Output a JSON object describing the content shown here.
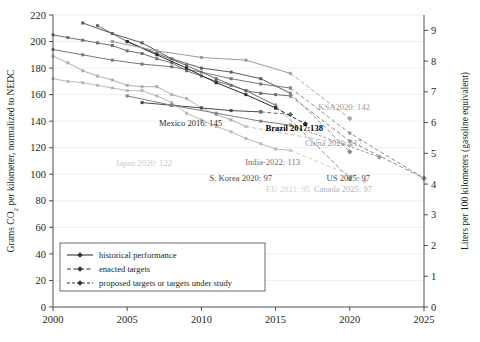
{
  "chart_data": {
    "type": "line",
    "title": "",
    "xlabel": "",
    "ylabel": "Grams CO2 per kilometer, normalized to NEDC",
    "ylabel_right": "Liters per 100 kilometers (gasoline equivalent)",
    "xlim": [
      2000,
      2025
    ],
    "ylim": [
      0,
      220
    ],
    "ylim_right": [
      0,
      9.5
    ],
    "xticks": [
      "2000",
      "2005",
      "2010",
      "2015",
      "2020",
      "2025"
    ],
    "yticks": [
      "0",
      "20",
      "40",
      "60",
      "80",
      "100",
      "120",
      "140",
      "160",
      "180",
      "200",
      "220"
    ],
    "yticks_right": [
      "0",
      "1",
      "2",
      "3",
      "4",
      "5",
      "6",
      "7",
      "8",
      "9"
    ],
    "grid": true,
    "legend_position": "lower-left",
    "legend": [
      {
        "label": "historical performance",
        "style": "solid"
      },
      {
        "label": "enacted targets",
        "style": "dashed-diamond"
      },
      {
        "label": "proposed targets or targets under study",
        "style": "dashed-small"
      }
    ],
    "series": [
      {
        "name": "EU",
        "color": "#b9b9b9",
        "kind": "historical",
        "x": [
          2000,
          2001,
          2002,
          2003,
          2004,
          2005,
          2006,
          2007,
          2008,
          2009,
          2010,
          2011,
          2012,
          2013,
          2014,
          2015,
          2016
        ],
        "y": [
          172,
          170,
          169,
          167,
          165,
          163,
          163,
          159,
          154,
          146,
          141,
          136,
          132,
          127,
          123,
          119,
          118
        ]
      },
      {
        "name": "EU target",
        "color": "#cfcfcf",
        "kind": "enacted",
        "x": [
          2016,
          2021
        ],
        "y": [
          118,
          95
        ]
      },
      {
        "name": "Japan",
        "color": "#b0b0b0",
        "kind": "historical",
        "x": [
          2000,
          2001,
          2002,
          2003,
          2004,
          2005,
          2006,
          2007,
          2008,
          2009,
          2010,
          2011,
          2012,
          2013
        ],
        "y": [
          189,
          184,
          178,
          174,
          171,
          167,
          166,
          166,
          160,
          157,
          150,
          145,
          141,
          136
        ]
      },
      {
        "name": "Japan target",
        "color": "#c4c4c4",
        "kind": "enacted",
        "x": [
          2013,
          2020
        ],
        "y": [
          136,
          122
        ]
      },
      {
        "name": "US",
        "color": "#6f6f6f",
        "kind": "historical",
        "x": [
          2000,
          2001,
          2002,
          2003,
          2004,
          2005,
          2006,
          2007,
          2008,
          2009,
          2010,
          2011,
          2012,
          2013,
          2014,
          2015,
          2016
        ],
        "y": [
          205,
          203,
          201,
          199,
          197,
          193,
          191,
          187,
          184,
          178,
          174,
          170,
          167,
          163,
          161,
          160,
          159
        ]
      },
      {
        "name": "US target",
        "color": "#8a8a8a",
        "kind": "enacted",
        "x": [
          2016,
          2020,
          2025
        ],
        "y": [
          159,
          125,
          97
        ]
      },
      {
        "name": "Canada",
        "color": "#777777",
        "kind": "historical",
        "x": [
          2000,
          2002,
          2004,
          2006,
          2008,
          2010,
          2012,
          2014,
          2016
        ],
        "y": [
          194,
          190,
          186,
          183,
          181,
          177,
          172,
          168,
          165
        ]
      },
      {
        "name": "Canada target",
        "color": "#8e8e8e",
        "kind": "enacted",
        "x": [
          2016,
          2020,
          2025
        ],
        "y": [
          165,
          131,
          97
        ]
      },
      {
        "name": "China",
        "color": "#5c5c5c",
        "kind": "historical",
        "x": [
          2002,
          2004,
          2006,
          2008,
          2010,
          2012,
          2014,
          2016
        ],
        "y": [
          214,
          206,
          199,
          187,
          180,
          177,
          172,
          161
        ]
      },
      {
        "name": "China target",
        "color": "#8b8b8b",
        "kind": "enacted",
        "x": [
          2016,
          2020
        ],
        "y": [
          161,
          117
        ]
      },
      {
        "name": "S. Korea",
        "color": "#6b6b6b",
        "kind": "historical",
        "x": [
          2003,
          2005,
          2007,
          2009,
          2011,
          2013,
          2015
        ],
        "y": [
          212,
          200,
          191,
          182,
          172,
          163,
          152
        ]
      },
      {
        "name": "S. Korea target",
        "color": "#8f8f8f",
        "kind": "enacted",
        "x": [
          2015,
          2020
        ],
        "y": [
          152,
          97
        ]
      },
      {
        "name": "Mexico",
        "color": "#4a4a4a",
        "kind": "historical",
        "x": [
          2006,
          2008,
          2010,
          2012,
          2014
        ],
        "y": [
          154,
          152,
          150,
          148,
          147
        ]
      },
      {
        "name": "Mexico target",
        "color": "#6a6a6a",
        "kind": "enacted",
        "x": [
          2014,
          2016
        ],
        "y": [
          147,
          145
        ]
      },
      {
        "name": "Brazil",
        "color": "#2b2b2b",
        "kind": "historical",
        "x": [
          2005,
          2007,
          2009,
          2011,
          2013,
          2015
        ],
        "y": [
          200,
          190,
          180,
          169,
          160,
          150
        ]
      },
      {
        "name": "Brazil target",
        "color": "#2b2b2b",
        "kind": "enacted",
        "x": [
          2015,
          2017
        ],
        "y": [
          150,
          138
        ]
      },
      {
        "name": "KSA",
        "color": "#9a9a9a",
        "kind": "historical",
        "x": [
          2004,
          2007,
          2010,
          2013,
          2016
        ],
        "y": [
          200,
          193,
          188,
          186,
          176
        ]
      },
      {
        "name": "KSA target",
        "color": "#a5a5a5",
        "kind": "enacted",
        "x": [
          2016,
          2020
        ],
        "y": [
          176,
          142
        ]
      },
      {
        "name": "India",
        "color": "#808080",
        "kind": "historical",
        "x": [
          2005,
          2008,
          2011,
          2014,
          2016
        ],
        "y": [
          159,
          152,
          146,
          140,
          137
        ]
      },
      {
        "name": "India target",
        "color": "#9b9b9b",
        "kind": "proposed",
        "x": [
          2016,
          2022
        ],
        "y": [
          137,
          113
        ]
      }
    ],
    "annotations": [
      {
        "text": "KSA2020: 142",
        "x": 370,
        "y": 110,
        "color": "#9a9a9a",
        "bold": false
      },
      {
        "text": "Mexico 2016: 145",
        "x": 222,
        "y": 126,
        "color": "#2b2b2b",
        "bold": false
      },
      {
        "text": "Brazil 2017:138",
        "x": 323,
        "y": 131,
        "color": "#000000",
        "bold": true
      },
      {
        "text": "China 2020: 117",
        "x": 362,
        "y": 146,
        "color": "#9a9a9a",
        "bold": false
      },
      {
        "text": "Japan 2020: 122",
        "x": 172,
        "y": 166,
        "color": "#c9c9c9",
        "bold": false
      },
      {
        "text": "India-2022: 113",
        "x": 300,
        "y": 165,
        "color": "#6f6f6f",
        "bold": false
      },
      {
        "text": "S. Korea 2020: 97",
        "x": 272,
        "y": 181,
        "color": "#4a4a4a",
        "bold": false
      },
      {
        "text": "US 2025: 97",
        "x": 370,
        "y": 181,
        "color": "#4a4a4a",
        "bold": false
      },
      {
        "text": "EU 2021: 95",
        "x": 310,
        "y": 192,
        "color": "#cfcfcf",
        "bold": false
      },
      {
        "text": "Canada 2025: 97",
        "x": 372,
        "y": 192,
        "color": "#b5b5b5",
        "bold": false
      }
    ]
  }
}
